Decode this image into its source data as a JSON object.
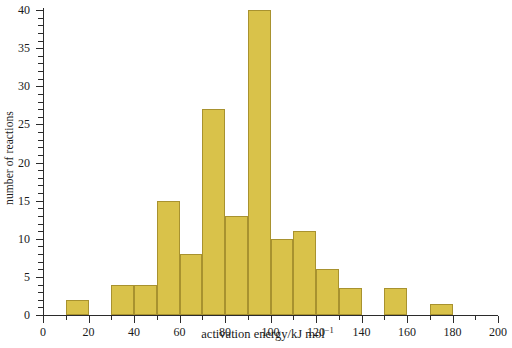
{
  "chart_data": {
    "type": "bar",
    "title": "",
    "subtitle": "",
    "xlabel_text": "activation energy/kJ mol",
    "xlabel_exponent": "−1",
    "ylabel": "number of reactions",
    "xlim": [
      0,
      200
    ],
    "ylim": [
      0,
      40
    ],
    "bin_width": 10,
    "grid": false,
    "legend": null,
    "bar_color": "#d9c24a",
    "bar_edge_color": "#a8922f",
    "axis_color": "#2b2b2b",
    "xticks": [
      0,
      20,
      40,
      60,
      80,
      100,
      120,
      140,
      160,
      180,
      200
    ],
    "xticks_minor_step": 10,
    "yticks": [
      0,
      5,
      10,
      15,
      20,
      25,
      30,
      35,
      40
    ],
    "yticks_minor_step": 1,
    "bins": [
      {
        "start": 0,
        "end": 10,
        "value": 0
      },
      {
        "start": 10,
        "end": 20,
        "value": 2
      },
      {
        "start": 20,
        "end": 30,
        "value": 0
      },
      {
        "start": 30,
        "end": 40,
        "value": 4
      },
      {
        "start": 40,
        "end": 50,
        "value": 4
      },
      {
        "start": 50,
        "end": 60,
        "value": 15
      },
      {
        "start": 60,
        "end": 70,
        "value": 8
      },
      {
        "start": 70,
        "end": 80,
        "value": 27
      },
      {
        "start": 80,
        "end": 90,
        "value": 13
      },
      {
        "start": 90,
        "end": 100,
        "value": 40
      },
      {
        "start": 100,
        "end": 110,
        "value": 10
      },
      {
        "start": 110,
        "end": 120,
        "value": 11
      },
      {
        "start": 120,
        "end": 130,
        "value": 6
      },
      {
        "start": 130,
        "end": 140,
        "value": 3.5
      },
      {
        "start": 140,
        "end": 150,
        "value": 0
      },
      {
        "start": 150,
        "end": 160,
        "value": 3.5
      },
      {
        "start": 160,
        "end": 170,
        "value": 0
      },
      {
        "start": 170,
        "end": 180,
        "value": 1.5
      },
      {
        "start": 180,
        "end": 190,
        "value": 0
      },
      {
        "start": 190,
        "end": 200,
        "value": 0
      }
    ]
  }
}
